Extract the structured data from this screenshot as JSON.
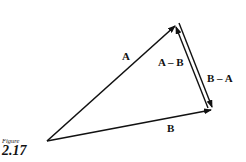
{
  "figure": {
    "caption_word": "Figure",
    "number": "2.17"
  },
  "vectors": {
    "A": {
      "label": "A",
      "from": [
        47,
        141
      ],
      "to": [
        176,
        25
      ]
    },
    "B": {
      "label": "B",
      "from": [
        47,
        141
      ],
      "to": [
        212,
        110
      ]
    },
    "A_minus_B": {
      "label": "A – B",
      "from": [
        209,
        108
      ],
      "to": [
        175,
        27
      ]
    },
    "B_minus_A": {
      "label": "B – A",
      "from": [
        179,
        24
      ],
      "to": [
        213,
        106
      ]
    }
  },
  "colors": {
    "stroke": "#111111",
    "background": "#ffffff"
  }
}
